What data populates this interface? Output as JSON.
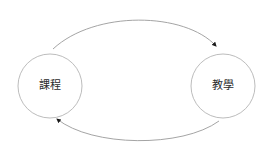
{
  "diagram": {
    "type": "cycle-diagram",
    "background_color": "#ffffff",
    "node_stroke_color": "#b4b4b4",
    "node_fill_color": "#ffffff",
    "edge_color": "#9a9a9a",
    "arrow_color": "#1a1a1a",
    "label_color": "#2b2b2b",
    "nodes": [
      {
        "id": "course",
        "label": "課程",
        "cx": 50,
        "cy": 86,
        "r": 32
      },
      {
        "id": "teaching",
        "label": "教學",
        "cx": 223,
        "cy": 86,
        "r": 32
      }
    ],
    "edges": [
      {
        "id": "course-to-teaching",
        "from": "course",
        "to": "teaching",
        "direction": "right",
        "arrowhead": "filled-triangle",
        "path": "M 53,49 C 95,10 185,12 216,46"
      },
      {
        "id": "teaching-to-course",
        "from": "teaching",
        "to": "course",
        "direction": "left",
        "arrowhead": "filled-triangle",
        "path": "M 219,121 C 182,148 92,147 57,119"
      }
    ]
  }
}
